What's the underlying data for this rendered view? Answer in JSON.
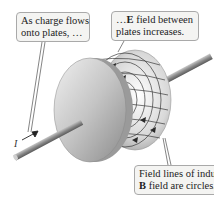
{
  "callouts": {
    "charge_flow": {
      "line1": "As charge flows",
      "line2": "onto plates, …"
    },
    "e_field": {
      "line1_prefix": "…",
      "line1_bold": "E",
      "line1_suffix": " field between",
      "line2": "plates increases."
    },
    "b_field": {
      "line1": "Field lines of induced",
      "line2_bold": "B",
      "line2_suffix": " field are circles."
    }
  },
  "labels": {
    "current": "I"
  },
  "colors": {
    "plate": "#c8c8c8",
    "wire": "#8a8a8a",
    "field_lines": "#444444",
    "callout_bg": "#f4f4f2",
    "callout_border": "#a9a9a9"
  }
}
